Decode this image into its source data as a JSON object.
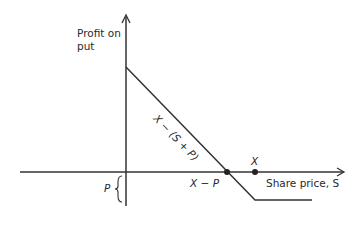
{
  "diagram": {
    "y_axis_label_line1": "Profit on",
    "y_axis_label_line2": "put",
    "x_axis_label": "Share price, S",
    "diagonal_label": "X − (S + P)",
    "breakeven_label": "X − P",
    "strike_label": "X",
    "premium_label": "P",
    "colors": {
      "line": "#333333",
      "text": "#2a2a2a",
      "background": "#ffffff"
    }
  }
}
